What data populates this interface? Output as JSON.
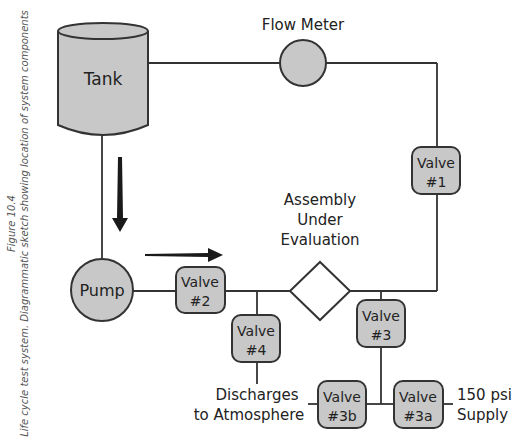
{
  "caption": {
    "figure": "Figure 10.4",
    "description": "Life cycle test system.  Diagrammatic sketch showing location of system components"
  },
  "colors": {
    "fill": "#c8c8c8",
    "stroke": "#333333",
    "arrow": "#1a1a1a",
    "background": "#ffffff"
  },
  "components": {
    "tank": "Tank",
    "flow_meter": "Flow Meter",
    "pump": "Pump",
    "assembly": [
      "Assembly",
      "Under",
      "Evaluation"
    ],
    "valve1": [
      "Valve",
      "#1"
    ],
    "valve2": [
      "Valve",
      "#2"
    ],
    "valve3": [
      "Valve",
      "#3"
    ],
    "valve3a": [
      "Valve",
      "#3a"
    ],
    "valve3b": [
      "Valve",
      "#3b"
    ],
    "valve4": [
      "Valve",
      "#4"
    ]
  },
  "labels": {
    "discharge": [
      "Discharges",
      "to Atmosphere"
    ],
    "supply": [
      "150 psi",
      "Supply"
    ]
  }
}
